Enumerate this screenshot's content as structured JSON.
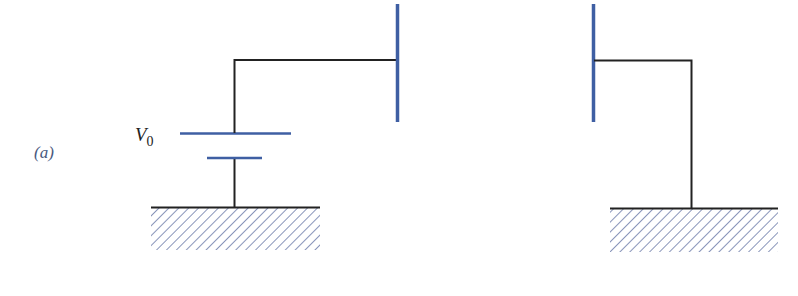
{
  "figure": {
    "panel_label": "(a)",
    "battery_label": "V",
    "battery_subscript": "0"
  },
  "colors": {
    "wire": "#222222",
    "plate": "#3f5fa3",
    "hatch": "#6a7aa8",
    "background": "#ffffff"
  },
  "components": {
    "left_circuit": [
      "ground",
      "battery V0",
      "wire",
      "capacitor plate (left)"
    ],
    "right_circuit": [
      "capacitor plate (right)",
      "wire",
      "ground"
    ]
  }
}
